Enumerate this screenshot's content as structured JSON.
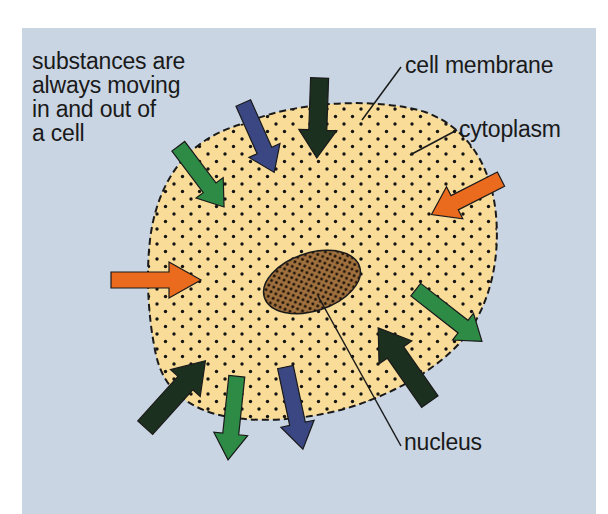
{
  "figure": {
    "colors": {
      "page_background": "#ffffff",
      "panel_background": "#c9d5e3",
      "cytoplasm_fill": "#f9dc98",
      "nucleus_fill": "#a0713e",
      "outline": "#1a1a1a",
      "arrow_dark_green": "#1c3020",
      "arrow_navy": "#3a4782",
      "arrow_green": "#2e8b46",
      "arrow_orange": "#ea6a1e"
    }
  },
  "labels": {
    "intro_lines": [
      "substances are",
      "always moving",
      "in and out of",
      "a cell"
    ],
    "cell_membrane": "cell membrane",
    "cytoplasm": "cytoplasm",
    "nucleus": "nucleus"
  },
  "arrows": [
    {
      "id": "top-dark-green-in",
      "color": "dark_green",
      "direction": "in",
      "heading": "down"
    },
    {
      "id": "top-navy-in",
      "color": "navy",
      "direction": "in",
      "heading": "down-right"
    },
    {
      "id": "upper-left-green-in",
      "color": "green",
      "direction": "in",
      "heading": "down-right"
    },
    {
      "id": "right-orange-in",
      "color": "orange",
      "direction": "in",
      "heading": "down-left"
    },
    {
      "id": "left-orange-in",
      "color": "orange",
      "direction": "in",
      "heading": "right"
    },
    {
      "id": "right-green-out",
      "color": "green",
      "direction": "out",
      "heading": "down-right"
    },
    {
      "id": "lower-right-dark-green-in",
      "color": "dark_green",
      "direction": "in",
      "heading": "up-left"
    },
    {
      "id": "lower-left-dark-green-in",
      "color": "dark_green",
      "direction": "in",
      "heading": "up-right"
    },
    {
      "id": "bottom-green-out",
      "color": "green",
      "direction": "out",
      "heading": "down"
    },
    {
      "id": "bottom-navy-out",
      "color": "navy",
      "direction": "out",
      "heading": "down"
    }
  ]
}
